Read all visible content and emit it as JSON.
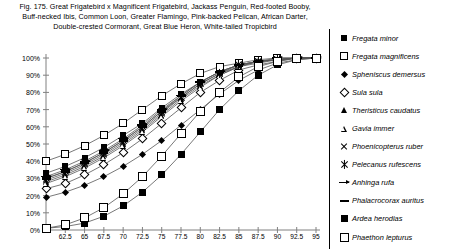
{
  "caption": {
    "line1": "Fig. 175.  Great Frigatebird x Magnificent Frigatebird, Jackass Penguin, Red-footed Booby,",
    "line2": "Buff-necked Ibis, Common Loon, Greater Flamingo, Pink-backed Pelican, African Darter,",
    "line3": "Double-crested Cormorant, Great Blue Heron, White-tailed Tropicbird"
  },
  "chart_data": {
    "type": "line",
    "xlabel": "",
    "ylabel": "",
    "xlim": [
      60,
      95
    ],
    "ylim": [
      0,
      1
    ],
    "grid": false,
    "legend_position": "right",
    "x": [
      60,
      62.5,
      65,
      67.5,
      70,
      72.5,
      75,
      77.5,
      80,
      82.5,
      85,
      87.5,
      90,
      92.5,
      95
    ],
    "xticks": [
      62.5,
      65,
      67.5,
      70,
      72.5,
      75,
      77.5,
      80,
      82.5,
      85,
      87.5,
      90,
      92.5,
      95
    ],
    "xticklabels": [
      "62.5",
      "65",
      "67.5",
      "70",
      "72.5",
      "75",
      "77.5",
      "80",
      "82.5",
      "85",
      "87.5",
      "90",
      "92.5",
      "95"
    ],
    "yticks": [
      0,
      10,
      20,
      30,
      40,
      50,
      60,
      70,
      80,
      90,
      100
    ],
    "yticklabels": [
      "0%",
      "10%",
      "20%",
      "30%",
      "40%",
      "50%",
      "60%",
      "70%",
      "80%",
      "90%",
      "100%"
    ],
    "series": [
      {
        "name": "Fregata minor",
        "marker": "square-filled",
        "values": [
          33,
          37,
          42,
          48,
          55,
          62,
          71,
          79,
          86,
          92,
          96,
          98,
          99,
          100,
          100
        ]
      },
      {
        "name": "Fregata magnificens",
        "marker": "square-open",
        "values": [
          40,
          44,
          49,
          55,
          62,
          70,
          78,
          85,
          91,
          95,
          97,
          99,
          100,
          100,
          100
        ]
      },
      {
        "name": "Spheniscus demersus",
        "marker": "diamond-filled",
        "values": [
          19,
          22,
          26,
          31,
          37,
          44,
          52,
          61,
          70,
          79,
          87,
          93,
          97,
          99,
          100
        ]
      },
      {
        "name": "Sula sula",
        "marker": "diamond-open",
        "values": [
          24,
          27,
          32,
          38,
          45,
          53,
          62,
          71,
          80,
          87,
          93,
          96,
          98,
          100,
          100
        ]
      },
      {
        "name": "Theristicus caudatus",
        "marker": "triangle-filled",
        "values": [
          28,
          32,
          37,
          43,
          50,
          58,
          67,
          76,
          84,
          90,
          95,
          98,
          99,
          100,
          100
        ]
      },
      {
        "name": "Gavia immer",
        "marker": "triangle-open",
        "values": [
          27,
          31,
          36,
          42,
          49,
          57,
          66,
          75,
          83,
          90,
          95,
          97,
          99,
          100,
          100
        ]
      },
      {
        "name": "Phoenicopterus ruber",
        "marker": "x",
        "values": [
          29,
          33,
          38,
          44,
          51,
          59,
          68,
          77,
          85,
          91,
          95,
          98,
          99,
          100,
          100
        ]
      },
      {
        "name": "Pelecanus rufescens",
        "marker": "asterisk",
        "values": [
          30,
          34,
          39,
          45,
          52,
          60,
          69,
          77,
          85,
          91,
          96,
          98,
          99,
          100,
          100
        ]
      },
      {
        "name": "Anhinga rufa",
        "marker": "arrow",
        "values": [
          31,
          35,
          40,
          46,
          53,
          61,
          70,
          78,
          86,
          92,
          96,
          98,
          100,
          100,
          100
        ]
      },
      {
        "name": "Phalacrocorax auritus",
        "marker": "dash",
        "values": [
          30,
          34,
          39,
          45,
          52,
          60,
          69,
          78,
          86,
          92,
          96,
          98,
          99,
          100,
          100
        ]
      },
      {
        "name": "Ardea herodias",
        "marker": "square-filled-lg",
        "values": [
          1,
          2,
          4,
          8,
          14,
          22,
          32,
          44,
          57,
          70,
          81,
          90,
          96,
          99,
          100
        ]
      },
      {
        "name": "Phaethon lepturus",
        "marker": "square-open-lg",
        "values": [
          1,
          3,
          7,
          13,
          21,
          31,
          43,
          56,
          69,
          80,
          89,
          95,
          98,
          100,
          100
        ]
      }
    ]
  },
  "legend": {
    "items": [
      {
        "label": "Fregata minor",
        "marker": "square-filled"
      },
      {
        "label": "Fregata magnificens",
        "marker": "square-open"
      },
      {
        "label": "Spheniscus demersus",
        "marker": "diamond-filled"
      },
      {
        "label": "Sula sula",
        "marker": "diamond-open"
      },
      {
        "label": "Theristicus caudatus",
        "marker": "triangle-filled"
      },
      {
        "label": "Gavia immer",
        "marker": "triangle-open"
      },
      {
        "label": "Phoenicopterus ruber",
        "marker": "x"
      },
      {
        "label": "Pelecanus rufescens",
        "marker": "asterisk"
      },
      {
        "label": "Anhinga rufa",
        "marker": "arrow"
      },
      {
        "label": "Phalacrocorax auritus",
        "marker": "dash"
      },
      {
        "label": "Ardea herodias",
        "marker": "square-filled-lg"
      },
      {
        "label": "Phaethon lepturus",
        "marker": "square-open-lg"
      }
    ]
  },
  "colors": {
    "ink": "#000000",
    "axis": "#808080",
    "background": "#ffffff"
  }
}
